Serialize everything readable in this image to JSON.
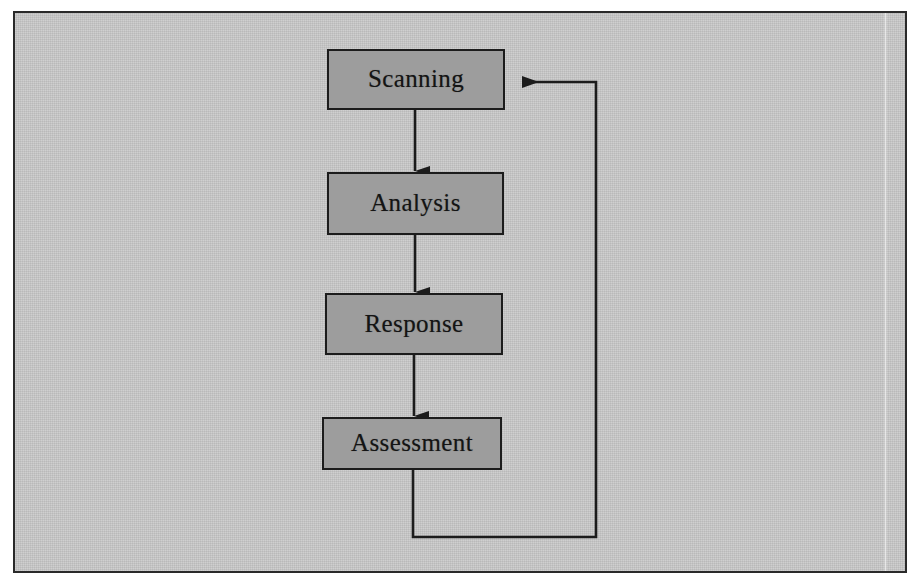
{
  "diagram": {
    "type": "flowchart",
    "orientation": "vertical",
    "background_color": "#c9c9c9",
    "node_fill_color": "#9d9d9d",
    "node_border_color": "#1c1c1c",
    "line_color": "#1c1c1c",
    "nodes": [
      {
        "id": "scanning",
        "label": "Scanning",
        "x": 327,
        "y": 49,
        "w": 178,
        "h": 61
      },
      {
        "id": "analysis",
        "label": "Analysis",
        "x": 327,
        "y": 172,
        "w": 177,
        "h": 63
      },
      {
        "id": "response",
        "label": "Response",
        "x": 325,
        "y": 293,
        "w": 178,
        "h": 62
      },
      {
        "id": "assessment",
        "label": "Assessment",
        "x": 322,
        "y": 417,
        "w": 180,
        "h": 53
      }
    ],
    "edges": [
      {
        "id": "scanning-to-analysis",
        "from": "scanning",
        "to": "analysis",
        "kind": "straight-down",
        "arrow": "down"
      },
      {
        "id": "analysis-to-response",
        "from": "analysis",
        "to": "response",
        "kind": "straight-down",
        "arrow": "down"
      },
      {
        "id": "response-to-assessment",
        "from": "response",
        "to": "assessment",
        "kind": "straight-down",
        "arrow": "down"
      },
      {
        "id": "assessment-to-scanning",
        "from": "assessment",
        "to": "scanning",
        "kind": "feedback-loop",
        "arrow": "left"
      }
    ]
  }
}
